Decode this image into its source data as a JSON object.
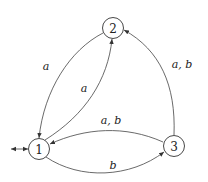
{
  "diagram": {
    "type": "finite-automaton",
    "states": [
      {
        "id": "1",
        "label": "1",
        "initial": true
      },
      {
        "id": "2",
        "label": "2"
      },
      {
        "id": "3",
        "label": "3"
      }
    ],
    "transitions": [
      {
        "from": "2",
        "to": "1",
        "label": "a"
      },
      {
        "from": "1",
        "to": "2",
        "label": "a"
      },
      {
        "from": "3",
        "to": "2",
        "label": "a, b"
      },
      {
        "from": "3",
        "to": "1",
        "label": "a, b"
      },
      {
        "from": "1",
        "to": "3",
        "label": "b"
      }
    ]
  },
  "labels": {
    "s1": "1",
    "s2": "2",
    "s3": "3",
    "t21": "a",
    "t12": "a",
    "t32": "a, b",
    "t31": "a, b",
    "t13": "b"
  }
}
